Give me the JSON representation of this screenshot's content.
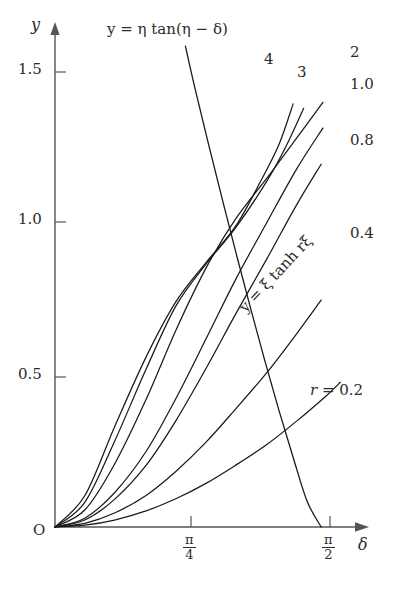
{
  "figure": {
    "axes": {
      "y_axis_label": "y",
      "x_axis_label": "δ",
      "origin_label": "O",
      "y_ticks": [
        "0.5",
        "1.0",
        "1.5"
      ],
      "y_tick_values": [
        0.5,
        1.0,
        1.5
      ],
      "x_ticks": [
        {
          "num": "π",
          "den": "4",
          "value": 0.7853981634
        },
        {
          "num": "π",
          "den": "2",
          "value": 1.5707963268
        }
      ]
    },
    "annotations": {
      "tan_equation": "y = η tan(η − δ)",
      "tanh_equation": "y = ξ tanh rξ",
      "r_label_prefix": "r",
      "r_label_equals": "=",
      "r_label_value": "0.2"
    },
    "curve_labels": [
      "4",
      "3",
      "2",
      "1.0",
      "0.8",
      "0.4"
    ],
    "colors": {
      "axis": "#555555",
      "curve": "#1a1a1a",
      "text": "#2b2b2b",
      "background": "#ffffff"
    }
  },
  "chart_data": {
    "type": "line",
    "title": "",
    "xlabel": "δ",
    "ylabel": "y",
    "xlim": [
      0,
      1.72
    ],
    "ylim": [
      0,
      1.72
    ],
    "grid": false,
    "legend": "inline curve labels at right end of each curve",
    "xticks": [
      0.7853981634,
      1.5707963268
    ],
    "xticklabels": [
      "π/4",
      "π/2"
    ],
    "yticks": [
      0.5,
      1.0,
      1.5
    ],
    "yticklabels": [
      "0.5",
      "1.0",
      "1.5"
    ],
    "series": [
      {
        "name": "r = 0.2",
        "label": "r = 0.2",
        "r": 0.2,
        "formula": "y = ξ tanh(rξ)",
        "x": [
          0.0,
          0.17,
          0.34,
          0.52,
          0.69,
          0.86,
          1.03,
          1.21,
          1.38,
          1.55,
          1.63
        ],
        "y": [
          0.0,
          0.006,
          0.023,
          0.053,
          0.093,
          0.143,
          0.203,
          0.272,
          0.349,
          0.433,
          0.477
        ]
      },
      {
        "name": "r = 0.4",
        "label": "0.4",
        "r": 0.4,
        "formula": "y = ξ tanh(rξ)",
        "x": [
          0.0,
          0.17,
          0.34,
          0.52,
          0.69,
          0.86,
          1.03,
          1.21,
          1.38,
          1.52
        ],
        "y": [
          0.0,
          0.012,
          0.046,
          0.104,
          0.183,
          0.278,
          0.388,
          0.509,
          0.637,
          0.748
        ]
      },
      {
        "name": "r = 0.8",
        "label": "0.8",
        "r": 0.8,
        "formula": "y = ξ tanh(rξ)",
        "x": [
          0.0,
          0.17,
          0.34,
          0.52,
          0.69,
          0.86,
          1.03,
          1.21,
          1.38,
          1.52
        ],
        "y": [
          0.0,
          0.023,
          0.091,
          0.203,
          0.35,
          0.52,
          0.7,
          0.884,
          1.062,
          1.196
        ]
      },
      {
        "name": "r = 1.0",
        "label": "1.0",
        "r": 1.0,
        "formula": "y = ξ tanh(rξ)",
        "x": [
          0.0,
          0.17,
          0.34,
          0.52,
          0.69,
          0.86,
          1.03,
          1.21,
          1.38,
          1.53
        ],
        "y": [
          0.0,
          0.029,
          0.113,
          0.249,
          0.423,
          0.617,
          0.814,
          1.004,
          1.18,
          1.315
        ]
      },
      {
        "name": "r = 2",
        "label": "2",
        "r": 2.0,
        "formula": "y = ξ tanh(rξ)",
        "x": [
          0.0,
          0.17,
          0.34,
          0.52,
          0.69,
          0.86,
          1.03,
          1.21,
          1.38,
          1.53
        ],
        "y": [
          0.0,
          0.056,
          0.207,
          0.42,
          0.648,
          0.851,
          1.014,
          1.15,
          1.282,
          1.4
        ]
      },
      {
        "name": "r = 3",
        "label": "3",
        "r": 3.0,
        "formula": "y = ξ tanh(rξ)",
        "x": [
          0.0,
          0.17,
          0.34,
          0.52,
          0.69,
          0.86,
          1.03,
          1.21,
          1.32,
          1.42
        ],
        "y": [
          0.0,
          0.081,
          0.282,
          0.52,
          0.728,
          0.865,
          0.985,
          1.14,
          1.255,
          1.38
        ]
      },
      {
        "name": "r = 4",
        "label": "4",
        "r": 4.0,
        "formula": "y = ξ tanh(rξ)",
        "x": [
          0.0,
          0.17,
          0.34,
          0.52,
          0.69,
          0.86,
          1.03,
          1.17,
          1.28,
          1.36
        ],
        "y": [
          0.0,
          0.103,
          0.33,
          0.56,
          0.742,
          0.87,
          0.99,
          1.135,
          1.262,
          1.395
        ]
      },
      {
        "name": "y = η tan(η − δ)",
        "label": "y = η tan(η − δ)",
        "formula": "y = η tan(η − δ)",
        "kind": "descending",
        "x": [
          0.745,
          0.8,
          0.88,
          0.96,
          1.04,
          1.12,
          1.2,
          1.28,
          1.36,
          1.44,
          1.52
        ],
        "y": [
          1.585,
          1.445,
          1.255,
          1.07,
          0.89,
          0.715,
          0.545,
          0.383,
          0.23,
          0.085,
          0.0
        ]
      }
    ]
  }
}
